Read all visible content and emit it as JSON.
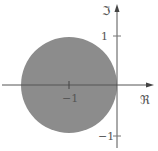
{
  "diagram": {
    "axes": {
      "real_label": "ℜ",
      "imag_label": "ℑ"
    },
    "ticks": {
      "imag_pos": "1",
      "imag_neg": "−1",
      "real_neg": "−1"
    },
    "disk": {
      "center": [
        -1,
        0
      ],
      "radius": 1,
      "fill": "#8c8c8c"
    },
    "axis_color": "#555555"
  }
}
